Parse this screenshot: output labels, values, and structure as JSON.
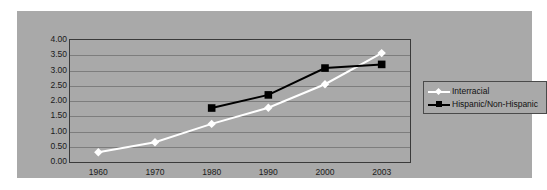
{
  "chart_data": {
    "type": "line",
    "title": "",
    "subtitle": "",
    "xlabel": "",
    "ylabel": "",
    "categories": [
      "1960",
      "1970",
      "1980",
      "1990",
      "2000",
      "2003"
    ],
    "ylim": [
      0,
      4
    ],
    "ytick_step": 0.5,
    "ytick_labels": [
      "4.00",
      "3.50",
      "3.00",
      "2.50",
      "2.00",
      "1.50",
      "1.00",
      "0.50",
      "0.00"
    ],
    "ytick_values": [
      4.0,
      3.5,
      3.0,
      2.5,
      2.0,
      1.5,
      1.0,
      0.5,
      0.0
    ],
    "grid": true,
    "grid_axis": "y",
    "legend_position": "right",
    "series": [
      {
        "name": "Interracial",
        "marker": "diamond",
        "color": "#ffffff",
        "x": [
          "1960",
          "1970",
          "1980",
          "1990",
          "2000",
          "2003"
        ],
        "values": [
          0.32,
          0.65,
          1.25,
          1.78,
          2.55,
          3.57
        ]
      },
      {
        "name": "Hispanic/Non-Hispanic",
        "marker": "square",
        "color": "#000000",
        "x": [
          "1980",
          "1990",
          "2000",
          "2003"
        ],
        "values": [
          1.77,
          2.2,
          3.08,
          3.2
        ]
      }
    ]
  },
  "legend": {
    "entries": [
      {
        "label": "Interracial",
        "marker": "diamond-marker-icon"
      },
      {
        "label": "Hispanic/Non-Hispanic",
        "marker": "square-marker-icon"
      }
    ]
  },
  "colors": {
    "plot_background": "#a9a9a9",
    "page_background": "#ffffff",
    "gridline": "#7d7d7d",
    "axis_border": "#3a3a3a",
    "series_interracial": "#ffffff",
    "series_hispanic": "#000000",
    "text": "#111111"
  }
}
